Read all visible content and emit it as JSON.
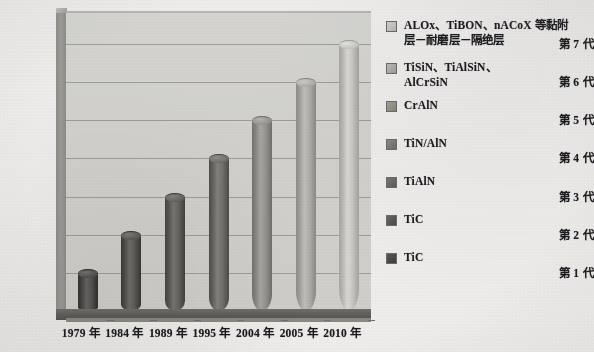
{
  "chart_data": {
    "type": "bar",
    "title": "",
    "subtitle": "",
    "xlabel": "",
    "ylabel": "",
    "orientation": "vertical",
    "style": "3d-cylinder",
    "grid": true,
    "legend_position": "right",
    "categories": [
      "1979 年",
      "1984 年",
      "1989 年",
      "1995 年",
      "2004 年",
      "2005 年",
      "2010 年"
    ],
    "ytick_labels": [
      "第 1 代",
      "第 2 代",
      "第 3 代",
      "第 4 代",
      "第 5 代",
      "第 6 代",
      "第 7 代"
    ],
    "ylim": [
      0,
      7.6
    ],
    "values": [
      1,
      2,
      3,
      4,
      5,
      6,
      7
    ],
    "series": [
      {
        "name": "涂层代际",
        "values": [
          1,
          2,
          3,
          4,
          5,
          6,
          7
        ],
        "point_labels": [
          "TiC",
          "TiC",
          "TiAlN",
          "TiN/AlN",
          "CrAlN",
          "TiSiN、TiAlSiN、AlCrSiN",
          "ALOx、TiBON、nACoX 等黏附层－耐磨层－隔绝层"
        ],
        "point_colors": [
          "#4b4a47",
          "#55534f",
          "#5e5c58",
          "#6a6864",
          "#8f8d88",
          "#a9a7a2",
          "#c3c1bc"
        ]
      }
    ],
    "bars": [
      {
        "category": "1979 年",
        "generation": "第 1 代",
        "value": 1,
        "material": "TiC",
        "color": "#4b4a47"
      },
      {
        "category": "1984 年",
        "generation": "第 2 代",
        "value": 2,
        "material": "TiC",
        "color": "#55534f"
      },
      {
        "category": "1989 年",
        "generation": "第 3 代",
        "value": 3,
        "material": "TiAlN",
        "color": "#5e5c58"
      },
      {
        "category": "1995 年",
        "generation": "第 4 代",
        "value": 4,
        "material": "TiN/AlN",
        "color": "#6a6864"
      },
      {
        "category": "2004 年",
        "generation": "第 5 代",
        "value": 5,
        "material": "CrAlN",
        "color": "#8f8d88"
      },
      {
        "category": "2005 年",
        "generation": "第 6 代",
        "value": 6,
        "material": "TiSiN、TiAlSiN、AlCrSiN",
        "color": "#a9a7a2"
      },
      {
        "category": "2010 年",
        "generation": "第 7 代",
        "value": 7,
        "material": "ALOx、TiBON、nACoX 等黏附层－耐磨层－隔绝层",
        "color": "#c3c1bc"
      }
    ],
    "colors": {
      "plot_background": "#d5d4d0",
      "gridline": "#8d8c87",
      "axis": "#6e6d69",
      "text": "#17161a",
      "floor": "#5d5c58",
      "left_wall": "#9e9d98"
    }
  },
  "axis": {
    "y_ticks": [
      {
        "label": "第 7 代",
        "value": 7
      },
      {
        "label": "第 6 代",
        "value": 6
      },
      {
        "label": "第 5 代",
        "value": 5
      },
      {
        "label": "第 4 代",
        "value": 4
      },
      {
        "label": "第 3 代",
        "value": 3
      },
      {
        "label": "第 2 代",
        "value": 2
      },
      {
        "label": "第 1 代",
        "value": 1
      }
    ],
    "x_ticks": [
      {
        "label": "1979 年"
      },
      {
        "label": "1984 年"
      },
      {
        "label": "1989 年"
      },
      {
        "label": "1995 年"
      },
      {
        "label": "2004 年"
      },
      {
        "label": "2005 年"
      },
      {
        "label": "2010 年"
      }
    ]
  },
  "legend": {
    "items": [
      {
        "line1": "ALOx、TiBON、nACoX 等黏附",
        "line2": "层－耐磨层－隔绝层",
        "color": "#c7c5c0"
      },
      {
        "line1": "TiSiN、TiAlSiN、",
        "line2": "AlCrSiN",
        "color": "#aeaca7"
      },
      {
        "line1": "CrAlN",
        "line2": "",
        "color": "#949289"
      },
      {
        "line1": "TiN/AlN",
        "line2": "",
        "color": "#7c7a76"
      },
      {
        "line1": "TiAlN",
        "line2": "",
        "color": "#696764"
      },
      {
        "line1": "TiC",
        "line2": "",
        "color": "#585653"
      },
      {
        "line1": "TiC",
        "line2": "",
        "color": "#494744"
      }
    ]
  }
}
